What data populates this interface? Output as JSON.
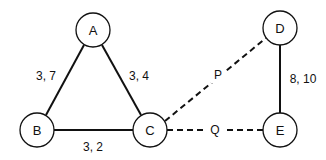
{
  "diagram": {
    "type": "network-graph",
    "nodes": [
      {
        "id": "A",
        "label": "A",
        "x": 93,
        "y": 30
      },
      {
        "id": "B",
        "label": "B",
        "x": 37,
        "y": 130
      },
      {
        "id": "C",
        "label": "C",
        "x": 150,
        "y": 130
      },
      {
        "id": "D",
        "label": "D",
        "x": 280,
        "y": 28
      },
      {
        "id": "E",
        "label": "E",
        "x": 280,
        "y": 130
      }
    ],
    "node_radius": 17,
    "edges": [
      {
        "from": "A",
        "to": "B",
        "label": "3, 7",
        "style": "solid"
      },
      {
        "from": "A",
        "to": "C",
        "label": "3, 4",
        "style": "solid"
      },
      {
        "from": "B",
        "to": "C",
        "label": "3, 2",
        "style": "solid"
      },
      {
        "from": "C",
        "to": "D",
        "label": "P",
        "style": "dashed"
      },
      {
        "from": "C",
        "to": "E",
        "label": "Q",
        "style": "dashed"
      },
      {
        "from": "D",
        "to": "E",
        "label": "8, 10",
        "style": "solid"
      }
    ]
  },
  "labels": {
    "node_a": "A",
    "node_b": "B",
    "node_c": "C",
    "node_d": "D",
    "node_e": "E",
    "edge_ab": "3, 7",
    "edge_ac": "3, 4",
    "edge_bc": "3, 2",
    "edge_cd": "P",
    "edge_ce": "Q",
    "edge_de": "8, 10"
  },
  "colors": {
    "stroke": "#111111",
    "background": "#ffffff"
  }
}
